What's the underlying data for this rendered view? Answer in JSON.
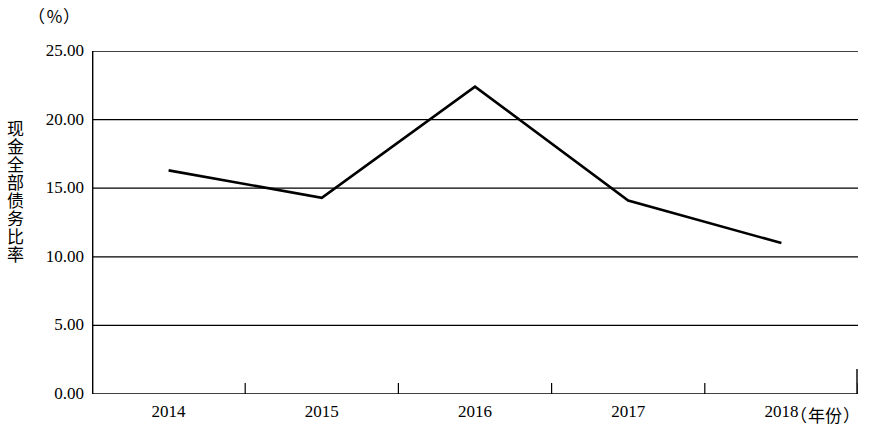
{
  "figure": {
    "unit_label": "（％）",
    "y_axis_title": "现金全部债务比率",
    "x_axis_title": "（年份）"
  },
  "chart_data": {
    "type": "line",
    "title": "",
    "subtitle": "",
    "xlabel": "（年份）",
    "ylabel": "现金全部债务比率",
    "unit": "%",
    "categories": [
      "2014",
      "2015",
      "2016",
      "2017",
      "2018"
    ],
    "values": [
      16.3,
      14.3,
      22.4,
      14.1,
      11.0
    ],
    "series": [
      {
        "name": "现金全部债务比率",
        "values": [
          16.3,
          14.3,
          22.4,
          14.1,
          11.0
        ]
      }
    ],
    "ylim": [
      0,
      25
    ],
    "ytick_labels": [
      "0.00",
      "5.00",
      "10.00",
      "15.00",
      "20.00",
      "25.00"
    ],
    "ytick_values": [
      0,
      5,
      10,
      15,
      20,
      25
    ],
    "xtick_labels": [
      "2014",
      "2015",
      "2016",
      "2017",
      "2018"
    ],
    "grid": true,
    "grid_axis": "y",
    "legend": "none",
    "line_color": "#000000",
    "grid_color": "#000000",
    "background_color": "#ffffff",
    "markers": false
  }
}
